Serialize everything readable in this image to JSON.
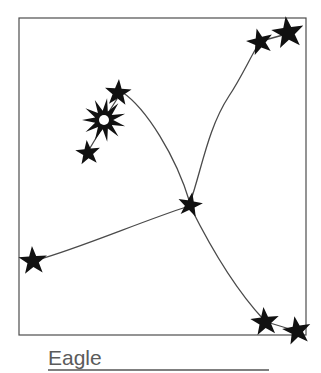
{
  "figure": {
    "title": "Eagle",
    "kind": "constellation-diagram",
    "caption_label": "Eagle",
    "frame": {
      "x": 19,
      "y": 18,
      "width": 287,
      "height": 317,
      "stroke_color": "#4d4d4d",
      "stroke_width": 1.2,
      "fill_color": "#ffffff"
    },
    "caption_rule": {
      "x1": 48,
      "x2": 269,
      "y": 370,
      "stroke_color": "#555555",
      "stroke_width": 1.6
    },
    "colors": {
      "star_fill": "#111111",
      "line_stroke": "#4a4a4a",
      "background": "#ffffff",
      "caption": "#5b5b5b",
      "frame": "#4d4d4d"
    }
  },
  "chart_data": {
    "type": "scatter",
    "title": "Eagle",
    "xlabel": "",
    "ylabel": "",
    "xlim": [
      19,
      306
    ],
    "ylim": [
      18,
      335
    ],
    "grid": false,
    "legend": "none",
    "star_count": 9,
    "line_count": 4,
    "stars": [
      {
        "id": "star-top-right-outer",
        "name": "top-right-outer-star",
        "x": 288,
        "y": 33,
        "radius": 17,
        "points": 5,
        "rotation": -8,
        "kind": "five-point"
      },
      {
        "id": "star-top-right-inner",
        "name": "top-right-inner-star",
        "x": 260,
        "y": 42,
        "radius": 14,
        "points": 5,
        "rotation": -14,
        "kind": "five-point"
      },
      {
        "id": "star-bright-altair",
        "name": "bright-burst-star",
        "x": 104,
        "y": 120,
        "radius": 22,
        "points": 11,
        "rotation": 8,
        "kind": "burst",
        "hollow_center_radius": 5
      },
      {
        "id": "star-upper-cluster",
        "name": "upper-cluster-star",
        "x": 118,
        "y": 93,
        "radius": 14,
        "points": 5,
        "rotation": 4,
        "kind": "five-point"
      },
      {
        "id": "star-lower-cluster",
        "name": "lower-cluster-star",
        "x": 88,
        "y": 153,
        "radius": 13,
        "points": 5,
        "rotation": -6,
        "kind": "five-point"
      },
      {
        "id": "star-center-junction",
        "name": "center-junction-star",
        "x": 190,
        "y": 205,
        "radius": 13,
        "points": 5,
        "rotation": 10,
        "kind": "five-point"
      },
      {
        "id": "star-left-wing-tip",
        "name": "left-wing-tip-star",
        "x": 33,
        "y": 261,
        "radius": 15,
        "points": 5,
        "rotation": -4,
        "kind": "five-point"
      },
      {
        "id": "star-bottom-right-inner",
        "name": "bottom-right-inner-star",
        "x": 265,
        "y": 322,
        "radius": 15,
        "points": 5,
        "rotation": -6,
        "kind": "five-point"
      },
      {
        "id": "star-bottom-right-outer",
        "name": "bottom-right-outer-star",
        "x": 297,
        "y": 331,
        "radius": 15,
        "points": 5,
        "rotation": -10,
        "kind": "five-point"
      }
    ],
    "lines": [
      {
        "id": "line-cluster-to-center",
        "name": "cluster-to-center-line",
        "path": "M 122 92 C 146 108 176 156 190 203"
      },
      {
        "id": "line-center-to-topright",
        "name": "center-to-top-right-line",
        "path": "M 190 203 C 202 168 208 128 229 96 C 241 78 250 58 258 45"
      },
      {
        "id": "line-leftwing-to-center",
        "name": "left-wing-to-center-line",
        "path": "M 37 260 C 80 248 140 222 189 206"
      },
      {
        "id": "line-center-to-bottomright",
        "name": "center-to-bottom-right-line",
        "path": "M 191 208 C 209 244 234 288 264 320"
      },
      {
        "id": "line-cluster-internal-upper",
        "name": "burst-to-upper-cluster-line",
        "path": "M 110 110 L 117 99"
      },
      {
        "id": "line-cluster-internal-lower",
        "name": "burst-to-lower-cluster-line",
        "path": "M 99 133 L 90 148"
      },
      {
        "id": "line-bottomright-pair",
        "name": "bottom-right-pair-line",
        "path": "M 270 323 L 293 330"
      },
      {
        "id": "line-topright-pair",
        "name": "top-right-pair-line",
        "path": "M 265 40 L 283 35"
      }
    ]
  }
}
